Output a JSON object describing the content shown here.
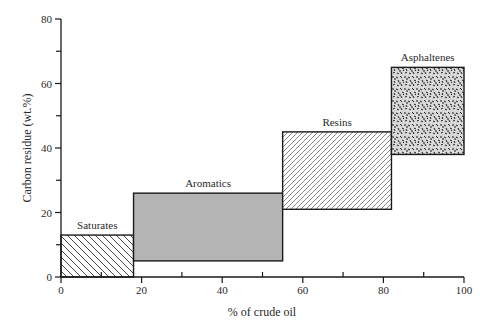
{
  "chart_data": {
    "type": "bar",
    "subtype": "variable-width floating range boxes",
    "title": "",
    "xlabel": "% of crude oil",
    "ylabel": "Carbon residue (wt.%)",
    "xlim": [
      0,
      100
    ],
    "ylim": [
      0,
      80
    ],
    "x_ticks": [
      0,
      20,
      40,
      60,
      80,
      100
    ],
    "x_minor_ticks": [
      10,
      30,
      50,
      70,
      90
    ],
    "y_ticks": [
      0,
      20,
      40,
      60,
      80
    ],
    "y_minor_ticks": [
      10,
      30,
      50,
      70
    ],
    "grid": false,
    "legend": null,
    "series": [
      {
        "name": "Saturates",
        "x_start": 0,
        "x_end": 18,
        "y_low": 0,
        "y_high": 13,
        "fill": "back-diagonal hatch"
      },
      {
        "name": "Aromatics",
        "x_start": 18,
        "x_end": 55,
        "y_low": 5,
        "y_high": 26,
        "fill": "gray"
      },
      {
        "name": "Resins",
        "x_start": 55,
        "x_end": 82,
        "y_low": 21,
        "y_high": 45,
        "fill": "forward-diagonal hatch"
      },
      {
        "name": "Asphaltenes",
        "x_start": 82,
        "x_end": 100,
        "y_low": 38,
        "y_high": 65,
        "fill": "dense speckle"
      }
    ]
  },
  "colors": {
    "axis": "#1a1a1a",
    "aromatics_fill": "#b4b4b4",
    "hatch": "#333333",
    "speckle": "#222222"
  }
}
